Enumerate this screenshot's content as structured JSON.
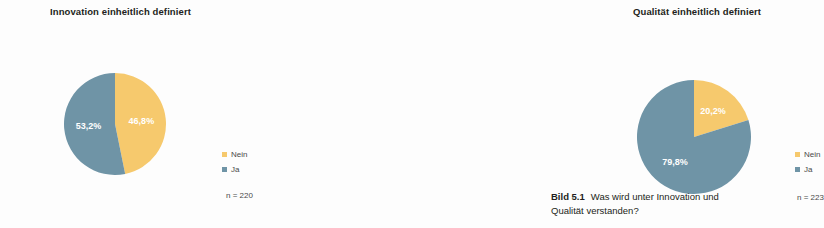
{
  "figure": {
    "background": "#fdfdfd",
    "colors": {
      "nein": "#f6c96d",
      "ja": "#6f94a6",
      "label_text": "#ffffff",
      "title_text": "#231f20",
      "legend_text": "#4a4a4a"
    },
    "caption": {
      "number": "Bild 5.1",
      "text": "Was wird unter Innovation und Qualität verstanden?"
    }
  },
  "charts": [
    {
      "id": "innovation",
      "title": "Innovation einheitlich definiert",
      "n_label": "n = 220",
      "legend": [
        {
          "label": "Nein",
          "color": "#f6c96d"
        },
        {
          "label": "Ja",
          "color": "#6f94a6"
        }
      ],
      "slices": [
        {
          "label": "Nein",
          "value": 46.8,
          "display": "46,8%",
          "color": "#f6c96d"
        },
        {
          "label": "Ja",
          "value": 53.2,
          "display": "53,2%",
          "color": "#6f94a6"
        }
      ]
    },
    {
      "id": "qualitaet",
      "title": "Qualität einheitlich definiert",
      "n_label": "n = 223",
      "legend": [
        {
          "label": "Nein",
          "color": "#f6c96d"
        },
        {
          "label": "Ja",
          "color": "#6f94a6"
        }
      ],
      "slices": [
        {
          "label": "Nein",
          "value": 20.2,
          "display": "20,2%",
          "color": "#f6c96d"
        },
        {
          "label": "Ja",
          "value": 79.8,
          "display": "79,8%",
          "color": "#6f94a6"
        }
      ]
    }
  ],
  "chart_data": [
    {
      "type": "pie",
      "title": "Innovation einheitlich definiert",
      "categories": [
        "Nein",
        "Ja"
      ],
      "values": [
        46.8,
        53.2
      ],
      "value_labels": [
        "46,8%",
        "53,2%"
      ],
      "colors": [
        "#f6c96d",
        "#6f94a6"
      ],
      "units": "percent",
      "sample_size": 220,
      "sample_size_label": "n = 220",
      "start_angle_deg": 0,
      "direction": "clockwise",
      "legend_position": "right",
      "grid": false
    },
    {
      "type": "pie",
      "title": "Qualität einheitlich definiert",
      "categories": [
        "Nein",
        "Ja"
      ],
      "values": [
        20.2,
        79.8
      ],
      "value_labels": [
        "20,2%",
        "79,8%"
      ],
      "colors": [
        "#f6c96d",
        "#6f94a6"
      ],
      "units": "percent",
      "sample_size": 223,
      "sample_size_label": "n = 223",
      "start_angle_deg": 0,
      "direction": "clockwise",
      "legend_position": "right",
      "grid": false
    }
  ]
}
